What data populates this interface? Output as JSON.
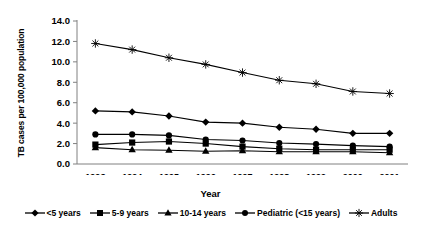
{
  "chart_data": {
    "type": "line",
    "title": "",
    "xlabel": "Year",
    "ylabel": "TB cases per 100,000 population",
    "categories": [
      "1993",
      "1994",
      "1995",
      "1996",
      "1997",
      "1998",
      "1999",
      "2000",
      "2001"
    ],
    "ylim": [
      0.0,
      14.0
    ],
    "ytick_labels": [
      "0.0",
      "2.0",
      "4.0",
      "6.0",
      "8.0",
      "10.0",
      "12.0",
      "14.0"
    ],
    "ytick_values": [
      0.0,
      2.0,
      4.0,
      6.0,
      8.0,
      10.0,
      12.0,
      14.0
    ],
    "grid": false,
    "legend_position": "bottom",
    "series": [
      {
        "name": "<5 years",
        "marker": "diamond",
        "values": [
          5.2,
          5.1,
          4.7,
          4.1,
          4.0,
          3.6,
          3.4,
          3.0,
          3.0
        ]
      },
      {
        "name": "5-9 years",
        "marker": "square",
        "values": [
          1.9,
          2.1,
          2.2,
          2.0,
          1.7,
          1.5,
          1.4,
          1.4,
          1.4
        ]
      },
      {
        "name": "10-14 years",
        "marker": "triangle",
        "values": [
          1.6,
          1.4,
          1.35,
          1.25,
          1.3,
          1.2,
          1.2,
          1.2,
          1.1
        ]
      },
      {
        "name": "Pediatric (<15 years)",
        "marker": "circle",
        "values": [
          2.9,
          2.9,
          2.8,
          2.4,
          2.3,
          2.05,
          1.95,
          1.8,
          1.7
        ]
      },
      {
        "name": "Adults",
        "marker": "asterisk",
        "values": [
          11.8,
          11.2,
          10.4,
          9.75,
          8.95,
          8.2,
          7.85,
          7.1,
          6.9
        ]
      }
    ]
  },
  "legend": {
    "items": [
      {
        "label": "<5 years",
        "marker": "diamond"
      },
      {
        "label": "5-9 years",
        "marker": "square"
      },
      {
        "label": "10-14 years",
        "marker": "triangle"
      },
      {
        "label": "Pediatric (<15 years)",
        "marker": "circle"
      },
      {
        "label": "Adults",
        "marker": "asterisk"
      }
    ]
  },
  "colors": {
    "line": "#000000",
    "axis": "#808080",
    "text": "#000000"
  }
}
